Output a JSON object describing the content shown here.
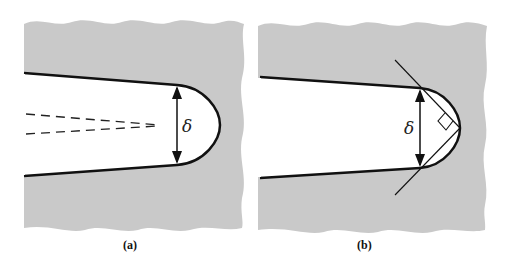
{
  "figure": {
    "panels": [
      {
        "id": "a",
        "caption": "(a)",
        "symbol": "δ",
        "description": "Crack tip with blunted tip; dashed lines indicate original sharp crack faces; δ marks crack tip opening"
      },
      {
        "id": "b",
        "caption": "(b)",
        "symbol": "δ",
        "description": "Crack tip opening displacement defined by 90° intercept of lines from tip"
      }
    ],
    "colors": {
      "material": "#c9c9c9",
      "crack": "#ffffff",
      "line": "#111111"
    }
  }
}
